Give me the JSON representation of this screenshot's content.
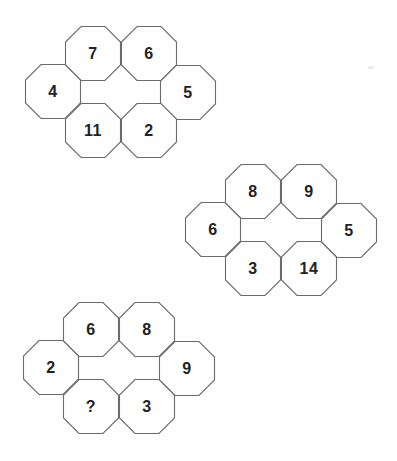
{
  "puzzles": [
    {
      "name": "puzzle-1",
      "cells": {
        "top_left": "7",
        "top_right": "6",
        "left": "4",
        "right": "5",
        "bottom_left": "11",
        "bottom_right": "2"
      }
    },
    {
      "name": "puzzle-2",
      "cells": {
        "top_left": "8",
        "top_right": "9",
        "left": "6",
        "right": "5",
        "bottom_left": "3",
        "bottom_right": "14"
      }
    },
    {
      "name": "puzzle-3",
      "cells": {
        "top_left": "6",
        "top_right": "8",
        "left": "2",
        "right": "9",
        "bottom_left": "?",
        "bottom_right": "3"
      }
    }
  ],
  "colors": {
    "background": "#ffffff",
    "outline": "#6b6b6b",
    "text": "#222222"
  }
}
